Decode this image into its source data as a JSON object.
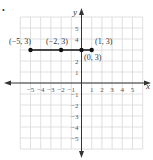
{
  "chart_data": {
    "type": "scatter",
    "title": "",
    "xlabel": "x",
    "ylabel": "y",
    "xlim": [
      -6,
      6
    ],
    "ylim": [
      -6,
      6
    ],
    "grid": true,
    "x_ticks": [
      -5,
      -4,
      -3,
      -2,
      -1,
      1,
      2,
      3,
      4,
      5
    ],
    "y_ticks": [
      -5,
      -4,
      -3,
      -2,
      -1,
      1,
      2,
      4,
      5
    ],
    "x_tick_labels": [
      "−5",
      "−4",
      "−3",
      "−2",
      "−1",
      "1",
      "2",
      "3",
      "4",
      "5"
    ],
    "y_tick_labels": [
      "−5",
      "−4",
      "−3",
      "−2",
      "−1",
      "1",
      "2",
      "4",
      "5"
    ],
    "points": [
      {
        "x": -5,
        "y": 3,
        "label": "(−5, 3)"
      },
      {
        "x": -2,
        "y": 3,
        "label": "(−2, 3)"
      },
      {
        "x": 0,
        "y": 3,
        "label": "(0, 3)"
      },
      {
        "x": 1,
        "y": 3,
        "label": "(1, 3)"
      }
    ],
    "segment": {
      "from": [
        -5,
        3
      ],
      "to": [
        1,
        3
      ]
    },
    "colors": {
      "grid": "#d8d8d8",
      "axis": "#333333",
      "points": "#111111"
    }
  },
  "labels": {
    "x_axis": "x",
    "y_axis": "y",
    "p1": "(−5, 3)",
    "p2": "(−2, 3)",
    "p3": "(0, 3)",
    "p4": "(1, 3)",
    "bullet": "•"
  }
}
